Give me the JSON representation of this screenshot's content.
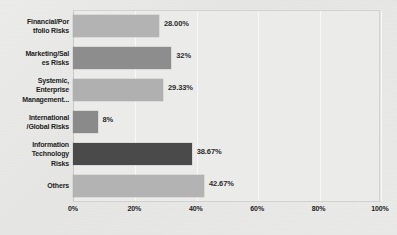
{
  "chart_data": {
    "type": "bar",
    "orientation": "horizontal",
    "title": "",
    "xlabel": "",
    "ylabel": "",
    "categories": [
      "Financial/Por tfolio Risks",
      "Marketing/Sal es Risks",
      "Systemic, Enterprise Management...",
      "International /Global Risks",
      "Information Technology Risks",
      "Others"
    ],
    "values": [
      28.0,
      32,
      29.33,
      8,
      38.67,
      42.67
    ],
    "value_labels": [
      "28.00%",
      "32%",
      "29.33%",
      "8%",
      "38.67%",
      "42.67%"
    ],
    "xlim": [
      0,
      100
    ],
    "xticks": [
      0,
      20,
      40,
      60,
      80,
      100
    ],
    "xtick_labels": [
      "0%",
      "20%",
      "40%",
      "60%",
      "80%",
      "100%"
    ],
    "grid": true,
    "grid_axis": "x",
    "legend": false,
    "bar_colors": [
      "#b3b3b3",
      "#8d8d8d",
      "#b0b0b0",
      "#8a8a8a",
      "#4a4a4a",
      "#b3b3b3"
    ]
  },
  "categories_display": [
    {
      "lines": [
        "Financial/Por",
        "tfolio Risks"
      ]
    },
    {
      "lines": [
        "Marketing/Sal",
        "es Risks"
      ]
    },
    {
      "lines": [
        "Systemic,",
        "Enterprise",
        "Management..."
      ]
    },
    {
      "lines": [
        "International",
        "/Global Risks"
      ]
    },
    {
      "lines": [
        "Information",
        "Technology",
        "Risks"
      ]
    },
    {
      "lines": [
        "Others"
      ]
    }
  ]
}
